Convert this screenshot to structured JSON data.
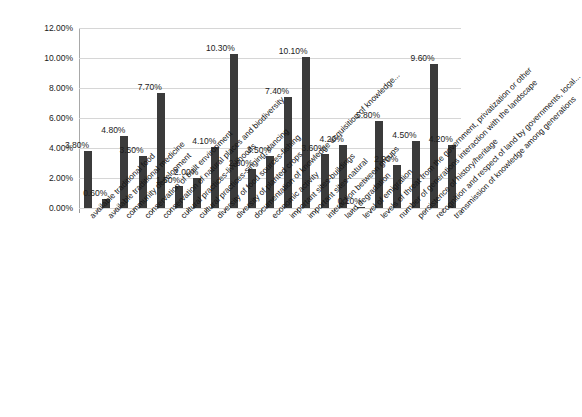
{
  "chart_data": {
    "type": "bar",
    "title": "",
    "subtitle": "",
    "xlabel": "",
    "ylabel": "",
    "ylim": [
      0,
      12
    ],
    "ytick_labels": [
      "0.00%",
      "2.00%",
      "4.00%",
      "6.00%",
      "8.00%",
      "10.00%",
      "12.00%"
    ],
    "ytick_values": [
      0,
      2,
      4,
      6,
      8,
      10,
      12
    ],
    "grid": true,
    "legend": false,
    "legend_position": "none",
    "bar_color": "#3b3b3b",
    "data_labels_shown": true,
    "categories": [
      "available traditional food",
      "available traditional medicine",
      "community development",
      "conservation of built environment",
      "conservation of natural places and biodiversity",
      "cultural practices-livelihoods",
      "cultural practices-singing, dancing",
      "diversity of food sources-fishing",
      "diversity of planted crops",
      "documentation of knowledge acquisition of knowledge...",
      "economic activity",
      "important sites-buildings",
      "important sites-natural",
      "interaction between groups",
      "land degradation",
      "level of emigration",
      "levels of threat from the government, privatization or other",
      "number of generations interaction with the landscape",
      "persistence of history/heritage",
      "recognition and respect of land by governments, local...",
      "transmission of knowledge among generations"
    ],
    "values": [
      3.8,
      0.6,
      4.8,
      3.5,
      7.7,
      1.5,
      2.0,
      4.1,
      10.3,
      2.6,
      3.5,
      7.4,
      10.1,
      3.6,
      4.2,
      0.1,
      5.8,
      2.9,
      4.5,
      9.6,
      4.2
    ],
    "value_labels": [
      "3.80%",
      "0.60%",
      "4.80%",
      "3.50%",
      "7.70%",
      "1.50%",
      "2.00%",
      "4.10%",
      "10.30%",
      "2.60%",
      "3.50%",
      "7.40%",
      "10.10%",
      "3.60%",
      "4.20%",
      "0.10%",
      "5.80%",
      "2.90%",
      "4.50%",
      "9.60%",
      "4.20%"
    ]
  }
}
